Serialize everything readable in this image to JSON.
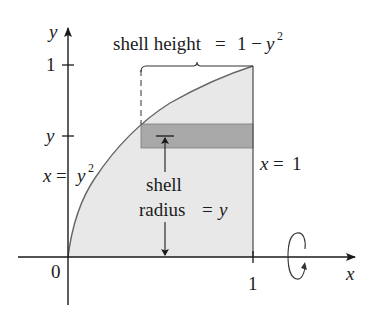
{
  "diagram": {
    "type": "shell-method",
    "colors": {
      "region_fill": "#e8e8e8",
      "shell_fill": "#a9a9a9",
      "curve": "#666666",
      "axis": "#1a1a1a"
    },
    "axes": {
      "x_label": "x",
      "y_label": "y",
      "origin_label": "0",
      "x_tick_label": "1",
      "y_tick_one_label": "1",
      "y_tick_var_label": "y"
    },
    "curve_label": {
      "lhs": "x",
      "eq": "=",
      "rhs_base": "y",
      "rhs_exp": "2"
    },
    "line_label": {
      "lhs": "x",
      "eq": "=",
      "rhs": "1"
    },
    "height_label": {
      "text": "shell height",
      "eq": "=",
      "value": "1 −",
      "var": "y",
      "exp": "2"
    },
    "radius_label": {
      "line1": "shell",
      "line2": "radius",
      "eq": "=",
      "var": "y"
    },
    "rotation_icon": "rotation-about-x-axis"
  }
}
